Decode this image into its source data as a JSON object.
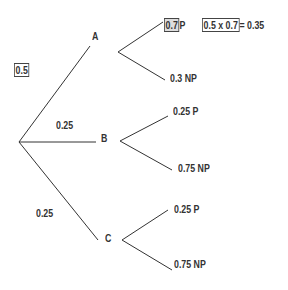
{
  "tree": {
    "root_probability_label": "0.5",
    "branches": [
      {
        "node": "A",
        "probability": "0.5",
        "children": [
          {
            "prob": "0.7",
            "outcome": "P",
            "highlight": true
          },
          {
            "prob": "0.3",
            "outcome": "NP"
          }
        ]
      },
      {
        "node": "B",
        "probability": "0.25",
        "children": [
          {
            "prob": "0.25",
            "outcome": "P"
          },
          {
            "prob": "0.75",
            "outcome": "NP"
          }
        ]
      },
      {
        "node": "C",
        "probability": "0.25",
        "children": [
          {
            "prob": "0.25",
            "outcome": "P"
          },
          {
            "prob": "0.75",
            "outcome": "NP"
          }
        ]
      }
    ],
    "calculation": {
      "expr": "0.5 x 0.7",
      "result": "= 0.35"
    }
  },
  "labels": {
    "root_prob": "0.5",
    "b_prob": "0.25",
    "c_prob": "0.25",
    "node_a": "A",
    "node_b": "B",
    "node_c": "C",
    "a_p_prob": "0.7",
    "a_p_outcome": "P",
    "a_np": "0.3 NP",
    "b_p": "0.25 P",
    "b_np": "0.75 NP",
    "c_p": "0.25 P",
    "c_np": "0.75 NP",
    "calc_expr": "0.5 x 0.7",
    "calc_result": "= 0.35"
  }
}
